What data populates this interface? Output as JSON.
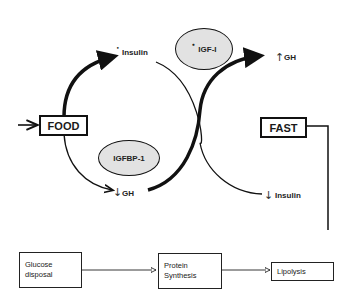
{
  "diagram": {
    "inputs": {
      "food": "FOOD",
      "fast": "FAST"
    },
    "mediators": {
      "igf1": "IGF-I",
      "igfbp1": "IGFBP-1"
    },
    "fed_state": {
      "insulin": {
        "label": "Insulin",
        "marker": "•",
        "direction": "up"
      },
      "gh": {
        "label": "GH",
        "arrow": "↓",
        "direction": "down"
      }
    },
    "fasting_state": {
      "gh": {
        "label": "GH",
        "arrow": "↑",
        "direction": "up"
      },
      "insulin": {
        "label": "Insulin",
        "arrow": "↓",
        "direction": "down"
      }
    },
    "igf1_marker": "•",
    "processes": [
      {
        "label": "Glucose\ndisposal"
      },
      {
        "label": "Protein\nSynthesis"
      },
      {
        "label": "Lipolysis"
      }
    ],
    "colors": {
      "line": "#111111",
      "ellipse_fill": "#e2e2e2",
      "background": "#ffffff"
    }
  }
}
